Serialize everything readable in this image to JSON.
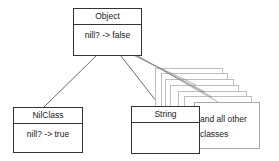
{
  "diagram": {
    "type": "class-hierarchy",
    "nodes": [
      {
        "id": "object",
        "title": "Object",
        "method": "nill? -> false"
      },
      {
        "id": "nilclass",
        "title": "NilClass",
        "method": "nill? -> true"
      },
      {
        "id": "string",
        "title": "String",
        "method": ""
      },
      {
        "id": "others",
        "label_line1": "and all other",
        "label_line2": "classes"
      }
    ],
    "edges": [
      {
        "from": "object",
        "to": "nilclass"
      },
      {
        "from": "object",
        "to": "string"
      },
      {
        "from": "object",
        "to": "others"
      }
    ],
    "colors": {
      "stroke": "#333333",
      "stack_stroke": "#bdbdbd",
      "background": "#ffffff"
    }
  }
}
